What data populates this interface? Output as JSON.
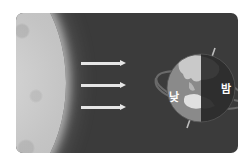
{
  "diagram": {
    "sun": {
      "name": "sun",
      "color": "#c8c8c8"
    },
    "arrows": [
      {
        "name": "sunlight-ray-1",
        "y": 49
      },
      {
        "name": "sunlight-ray-2",
        "y": 71
      },
      {
        "name": "sunlight-ray-3",
        "y": 93
      }
    ],
    "earth": {
      "day_label": "낮",
      "night_label": "밤",
      "day_color": "#8a8a8a",
      "night_color": "#2e2e2e"
    },
    "colors": {
      "card_background": "#3b3b3b",
      "arrow": "#e6e6e6",
      "orbit_line": "#6a6a6a"
    }
  }
}
